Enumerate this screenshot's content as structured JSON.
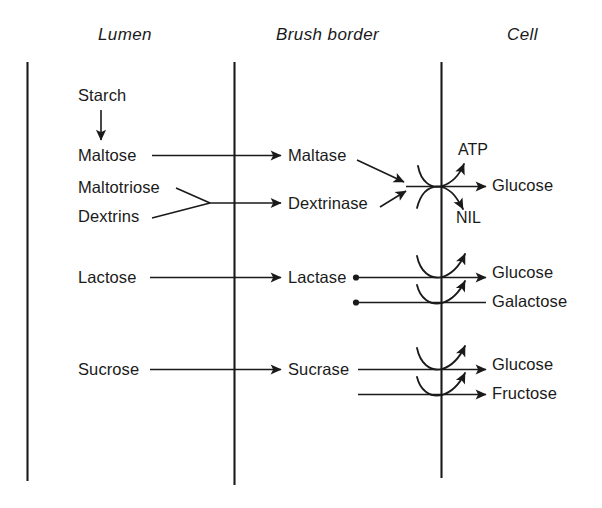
{
  "figure": {
    "background_color": "#ffffff",
    "ink_color": "#1a1a1a",
    "width": 602,
    "height": 508
  },
  "headers": [
    {
      "id": "lumen",
      "label": "Lumen"
    },
    {
      "id": "brush_border",
      "label": "Brush border"
    },
    {
      "id": "cell",
      "label": "Cell"
    }
  ],
  "columns": {
    "lumen": {
      "substrates": [
        {
          "id": "starch",
          "label": "Starch"
        },
        {
          "id": "maltose",
          "label": "Maltose"
        },
        {
          "id": "maltotriose",
          "label": "Maltotriose"
        },
        {
          "id": "dextrins",
          "label": "Dextrins"
        },
        {
          "id": "lactose",
          "label": "Lactose"
        },
        {
          "id": "sucrose",
          "label": "Sucrose"
        }
      ]
    },
    "brush_border": {
      "enzymes": [
        {
          "id": "maltase",
          "label": "Maltase"
        },
        {
          "id": "dextrinase",
          "label": "Dextrinase"
        },
        {
          "id": "lactase",
          "label": "Lactase"
        },
        {
          "id": "sucrase",
          "label": "Sucrase"
        }
      ]
    },
    "cell": {
      "products": [
        {
          "id": "glucose_1",
          "label": "Glucose"
        },
        {
          "id": "glucose_2",
          "label": "Glucose"
        },
        {
          "id": "galactose",
          "label": "Galactose"
        },
        {
          "id": "glucose_3",
          "label": "Glucose"
        },
        {
          "id": "fructose",
          "label": "Fructose"
        }
      ],
      "cofactors": [
        {
          "id": "atp",
          "label": "ATP"
        },
        {
          "id": "nil",
          "label": "NIL"
        }
      ]
    }
  },
  "reactions": [
    {
      "id": "starch-to-maltose",
      "from": "Starch",
      "to": "Maltose",
      "arrow": "down"
    },
    {
      "id": "maltose-to-maltase",
      "from": "Maltose",
      "to": "Maltase",
      "arrow": "right"
    },
    {
      "id": "maltotriose-dextrins-to-dextrinase",
      "from": "Maltotriose, Dextrins",
      "to": "Dextrinase",
      "arrow": "right-converging"
    },
    {
      "id": "maltase-dextrinase-to-glucose",
      "from": "Maltase, Dextrinase",
      "to": "Glucose",
      "arrow": "right-converging",
      "cofactor_in": "ATP",
      "cofactor_out": "NIL"
    },
    {
      "id": "lactose-to-lactase",
      "from": "Lactose",
      "to": "Lactase",
      "arrow": "right"
    },
    {
      "id": "lactase-to-glucose",
      "from": "Lactase",
      "to": "Glucose",
      "arrow": "right"
    },
    {
      "id": "lactase-to-galactose",
      "from": "Lactase",
      "to": "Galactose",
      "arrow": "right-plain"
    },
    {
      "id": "sucrose-to-sucrase",
      "from": "Sucrose",
      "to": "Sucrase",
      "arrow": "right"
    },
    {
      "id": "sucrase-to-glucose",
      "from": "Sucrase",
      "to": "Glucose",
      "arrow": "right"
    },
    {
      "id": "sucrase-to-fructose",
      "from": "Sucrase",
      "to": "Fructose",
      "arrow": "right"
    }
  ]
}
